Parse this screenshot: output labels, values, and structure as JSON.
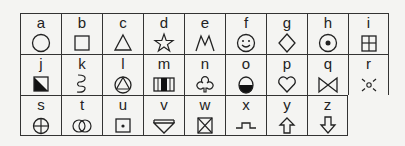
{
  "grid": {
    "rows": [
      [
        {
          "letter": "a",
          "symbol": "circle"
        },
        {
          "letter": "b",
          "symbol": "square"
        },
        {
          "letter": "c",
          "symbol": "triangle"
        },
        {
          "letter": "d",
          "symbol": "star"
        },
        {
          "letter": "e",
          "symbol": "m-shape"
        },
        {
          "letter": "f",
          "symbol": "smiley"
        },
        {
          "letter": "g",
          "symbol": "diamond"
        },
        {
          "letter": "h",
          "symbol": "circle-dot"
        },
        {
          "letter": "i",
          "symbol": "window-grid"
        }
      ],
      [
        {
          "letter": "j",
          "symbol": "half-filled-square"
        },
        {
          "letter": "k",
          "symbol": "squiggle"
        },
        {
          "letter": "l",
          "symbol": "triangle-in-circle"
        },
        {
          "letter": "m",
          "symbol": "striped-rectangle"
        },
        {
          "letter": "n",
          "symbol": "club-outline"
        },
        {
          "letter": "o",
          "symbol": "half-filled-egg"
        },
        {
          "letter": "p",
          "symbol": "heart"
        },
        {
          "letter": "q",
          "symbol": "bowtie"
        },
        {
          "letter": "r",
          "symbol": "sun-rays"
        }
      ],
      [
        {
          "letter": "s",
          "symbol": "crosshair-circle"
        },
        {
          "letter": "t",
          "symbol": "interlocking-rings"
        },
        {
          "letter": "u",
          "symbol": "square-dot"
        },
        {
          "letter": "v",
          "symbol": "inverted-triangle-bar"
        },
        {
          "letter": "w",
          "symbol": "crossed-box"
        },
        {
          "letter": "x",
          "symbol": "step-line"
        },
        {
          "letter": "y",
          "symbol": "arrow-up"
        },
        {
          "letter": "z",
          "symbol": "arrow-down"
        }
      ]
    ]
  }
}
